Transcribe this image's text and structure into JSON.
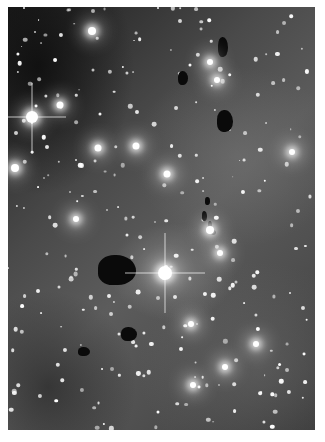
{
  "image": {
    "subject": "star field with emission nebulosity and dark globules",
    "colors": {
      "background_margin": "#ffffff",
      "sky_dark": "#1e1e1e",
      "nebula_mid": "#5c5c5c",
      "star": "#ffffff",
      "globule": "#0a0a0a"
    },
    "bright_stars": [
      {
        "x": 32,
        "y": 117,
        "r": 6,
        "spikes": 34
      },
      {
        "x": 165,
        "y": 273,
        "r": 7,
        "spikes": 40
      },
      {
        "x": 92,
        "y": 31,
        "r": 4,
        "spikes": 0
      },
      {
        "x": 15,
        "y": 168,
        "r": 4,
        "spikes": 0
      },
      {
        "x": 60,
        "y": 105,
        "r": 3.5,
        "spikes": 0
      },
      {
        "x": 98,
        "y": 148,
        "r": 3.5,
        "spikes": 0
      },
      {
        "x": 136,
        "y": 146,
        "r": 3.5,
        "spikes": 0
      },
      {
        "x": 167,
        "y": 174,
        "r": 3.5,
        "spikes": 0
      },
      {
        "x": 210,
        "y": 230,
        "r": 4,
        "spikes": 0
      },
      {
        "x": 210,
        "y": 62,
        "r": 3,
        "spikes": 0
      },
      {
        "x": 217,
        "y": 80,
        "r": 3,
        "spikes": 0
      },
      {
        "x": 292,
        "y": 152,
        "r": 3,
        "spikes": 0
      },
      {
        "x": 220,
        "y": 253,
        "r": 3,
        "spikes": 0
      },
      {
        "x": 191,
        "y": 324,
        "r": 3,
        "spikes": 0
      },
      {
        "x": 225,
        "y": 367,
        "r": 3,
        "spikes": 0
      },
      {
        "x": 193,
        "y": 385,
        "r": 3,
        "spikes": 0
      },
      {
        "x": 256,
        "y": 344,
        "r": 3,
        "spikes": 0
      },
      {
        "x": 76,
        "y": 219,
        "r": 3,
        "spikes": 0
      }
    ],
    "globules": [
      {
        "x": 90,
        "y": 248,
        "w": 38,
        "h": 30
      },
      {
        "x": 113,
        "y": 320,
        "w": 16,
        "h": 14
      },
      {
        "x": 70,
        "y": 340,
        "w": 12,
        "h": 9
      },
      {
        "x": 209,
        "y": 103,
        "w": 16,
        "h": 22
      },
      {
        "x": 210,
        "y": 30,
        "w": 10,
        "h": 20
      },
      {
        "x": 170,
        "y": 64,
        "w": 10,
        "h": 14
      },
      {
        "x": 197,
        "y": 190,
        "w": 5,
        "h": 8
      },
      {
        "x": 194,
        "y": 204,
        "w": 5,
        "h": 10
      },
      {
        "x": 200,
        "y": 214,
        "w": 4,
        "h": 9
      },
      {
        "x": 203,
        "y": 223,
        "w": 5,
        "h": 5
      }
    ],
    "faint_star_count": 260
  }
}
